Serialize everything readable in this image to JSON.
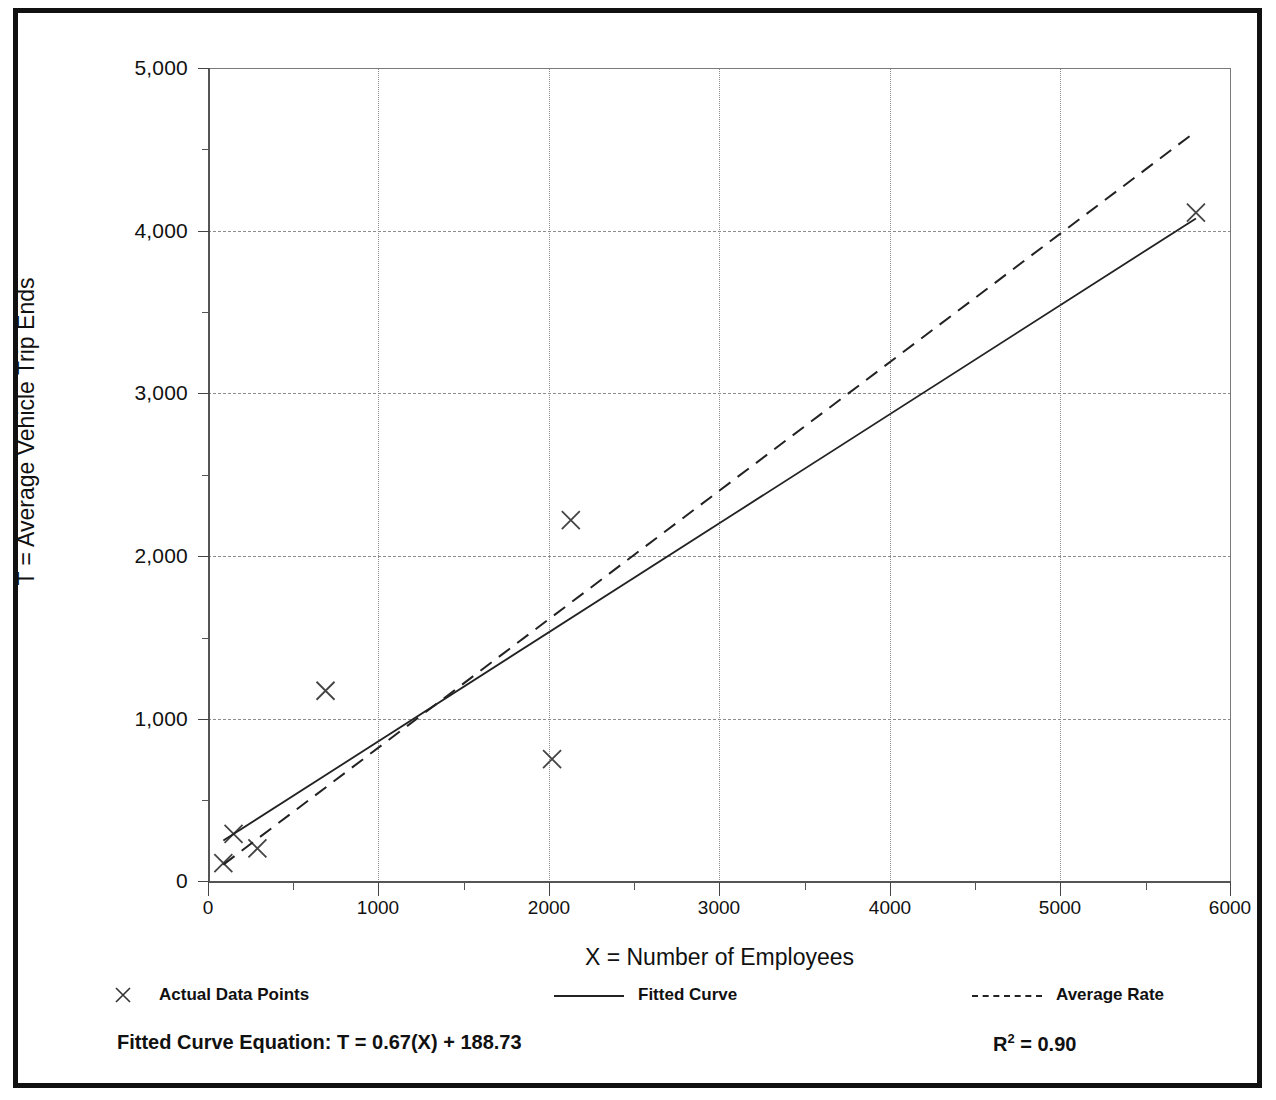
{
  "chart_data": {
    "type": "scatter",
    "title": "",
    "xlabel": "X = Number of Employees",
    "ylabel": "T = Average Vehicle Trip Ends",
    "xlim": [
      0,
      6000
    ],
    "ylim": [
      0,
      5000
    ],
    "x_ticks": [
      "0",
      "1000",
      "2000",
      "3000",
      "4000",
      "5000",
      "6000"
    ],
    "x_tick_values": [
      0,
      1000,
      2000,
      3000,
      4000,
      5000,
      6000
    ],
    "x_minor_step": 500,
    "y_ticks": [
      "0",
      "1,000",
      "2,000",
      "3,000",
      "4,000",
      "5,000"
    ],
    "y_tick_values": [
      0,
      1000,
      2000,
      3000,
      4000,
      5000
    ],
    "y_minor_step": 500,
    "grid": "dashed horizontal and dotted vertical gridlines at major ticks",
    "legend_position": "below plot",
    "series": [
      {
        "name": "Actual Data Points",
        "type": "scatter",
        "marker": "x",
        "points": [
          {
            "x": 90,
            "y": 110
          },
          {
            "x": 150,
            "y": 290
          },
          {
            "x": 290,
            "y": 200
          },
          {
            "x": 690,
            "y": 1170
          },
          {
            "x": 2020,
            "y": 750
          },
          {
            "x": 2130,
            "y": 2220
          },
          {
            "x": 5800,
            "y": 4110
          }
        ]
      },
      {
        "name": "Fitted Curve",
        "type": "line",
        "style": "solid",
        "equation": "T = 0.67(X) + 188.73",
        "slope": 0.67,
        "intercept": 188.73,
        "endpoints": [
          {
            "x": 90,
            "y": 249
          },
          {
            "x": 5800,
            "y": 4075
          }
        ]
      },
      {
        "name": "Average Rate",
        "type": "line",
        "style": "dashed",
        "slope": 0.79,
        "intercept": 30,
        "endpoints": [
          {
            "x": 90,
            "y": 101
          },
          {
            "x": 5800,
            "y": 4610
          }
        ]
      }
    ]
  },
  "legend": {
    "items": [
      {
        "label": "Actual Data Points",
        "marker": "x-marker"
      },
      {
        "label": "Fitted Curve",
        "marker": "solid-line"
      },
      {
        "label": "Average Rate",
        "marker": "dashed-line"
      }
    ]
  },
  "footer": {
    "equation_label": "Fitted Curve Equation:  T = 0.67(X) + 188.73",
    "r_squared_prefix": "R",
    "r_squared_exp": "2",
    "r_squared_value": " = 0.90"
  },
  "colors": {
    "frame": "#111111",
    "axis": "#555555",
    "grid": "#8c8c8c",
    "series": "#222222",
    "background": "#ffffff"
  }
}
